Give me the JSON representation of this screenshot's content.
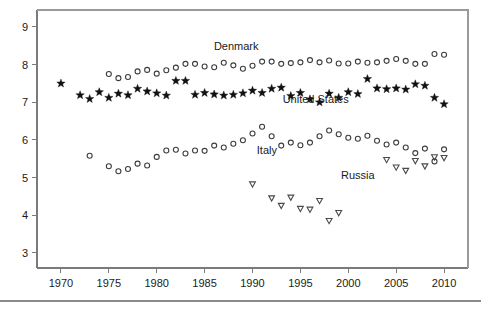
{
  "chart_data": {
    "type": "scatter",
    "title": "",
    "subtitle": "",
    "xlabel": "",
    "ylabel": "",
    "xlim": [
      1967.5,
      2012.5
    ],
    "ylim": [
      2.6,
      9.45
    ],
    "grid": false,
    "legend_position": "inline-annotations",
    "xticks": [
      1970,
      1975,
      1980,
      1985,
      1990,
      1995,
      2000,
      2005,
      2010
    ],
    "xtick_labels": [
      "1970",
      "1975",
      "1980",
      "1985",
      "1990",
      "1995",
      "2000",
      "2005",
      "2010"
    ],
    "yticks": [
      3,
      4,
      5,
      6,
      7,
      8,
      9
    ],
    "ytick_labels": [
      "3",
      "4",
      "5",
      "6",
      "7",
      "8",
      "9"
    ],
    "annotations": [
      {
        "text": "Denmark",
        "x": 1988.3,
        "y": 8.38,
        "series": "Denmark"
      },
      {
        "text": "United States",
        "x": 1996.6,
        "y": 6.97,
        "series": "United States"
      },
      {
        "text": "Italy",
        "x": 1991.5,
        "y": 5.62,
        "series": "Italy"
      },
      {
        "text": "Russia",
        "x": 2001.0,
        "y": 4.95,
        "series": "Russia"
      }
    ],
    "series": [
      {
        "name": "Denmark",
        "marker": "open-circle",
        "color": "#3d3d3d",
        "x": [
          1975,
          1976,
          1977,
          1978,
          1979,
          1980,
          1981,
          1982,
          1983,
          1984,
          1985,
          1986,
          1987,
          1988,
          1989,
          1990,
          1991,
          1992,
          1993,
          1994,
          1995,
          1996,
          1997,
          1998,
          1999,
          2000,
          2001,
          2002,
          2003,
          2004,
          2005,
          2006,
          2007,
          2008,
          2009,
          2010
        ],
        "y": [
          7.75,
          7.64,
          7.67,
          7.82,
          7.86,
          7.76,
          7.85,
          7.92,
          8.02,
          8.02,
          7.95,
          7.93,
          8.05,
          7.98,
          7.89,
          7.97,
          8.08,
          8.08,
          8.02,
          8.04,
          8.06,
          8.12,
          8.06,
          8.11,
          8.03,
          8.03,
          8.08,
          8.05,
          8.06,
          8.1,
          8.15,
          8.1,
          8.02,
          8.02,
          8.28,
          8.26
        ]
      },
      {
        "name": "United States",
        "marker": "filled-star",
        "color": "#111111",
        "x": [
          1970,
          1972,
          1973,
          1974,
          1975,
          1976,
          1977,
          1978,
          1979,
          1980,
          1981,
          1982,
          1983,
          1984,
          1985,
          1986,
          1987,
          1988,
          1989,
          1990,
          1991,
          1992,
          1993,
          1994,
          1995,
          1996,
          1997,
          1998,
          1999,
          2000,
          2001,
          2002,
          2003,
          2004,
          2005,
          2006,
          2007,
          2008,
          2009,
          2010
        ],
        "y": [
          7.5,
          7.19,
          7.09,
          7.27,
          7.12,
          7.23,
          7.19,
          7.36,
          7.29,
          7.24,
          7.18,
          7.57,
          7.57,
          7.2,
          7.25,
          7.21,
          7.18,
          7.2,
          7.24,
          7.31,
          7.25,
          7.36,
          7.39,
          7.17,
          7.25,
          7.08,
          7.0,
          7.23,
          7.12,
          7.27,
          7.22,
          7.62,
          7.37,
          7.35,
          7.37,
          7.34,
          7.48,
          7.44,
          7.12,
          6.95
        ]
      },
      {
        "name": "Italy",
        "marker": "open-circle",
        "color": "#3d3d3d",
        "x": [
          1973,
          1975,
          1976,
          1977,
          1978,
          1979,
          1980,
          1981,
          1982,
          1983,
          1984,
          1985,
          1986,
          1987,
          1988,
          1989,
          1990,
          1991,
          1992,
          1993,
          1994,
          1995,
          1996,
          1997,
          1998,
          1999,
          2000,
          2001,
          2002,
          2003,
          2004,
          2005,
          2006,
          2007,
          2008,
          2009,
          2010
        ],
        "y": [
          5.58,
          5.3,
          5.17,
          5.23,
          5.37,
          5.32,
          5.55,
          5.72,
          5.74,
          5.64,
          5.72,
          5.71,
          5.85,
          5.8,
          5.9,
          5.99,
          6.17,
          6.35,
          6.1,
          5.85,
          5.93,
          5.86,
          5.93,
          6.1,
          6.25,
          6.15,
          6.06,
          6.03,
          6.11,
          5.98,
          5.88,
          5.93,
          5.8,
          5.65,
          5.77,
          5.43,
          5.75
        ]
      },
      {
        "name": "Russia",
        "marker": "open-triangle-down",
        "color": "#4a4a4a",
        "x": [
          1990,
          1992,
          1993,
          1994,
          1995,
          1996,
          1997,
          1998,
          1999,
          2004,
          2005,
          2006,
          2007,
          2008,
          2009,
          2010
        ],
        "y": [
          4.82,
          4.45,
          4.25,
          4.47,
          4.17,
          4.15,
          4.38,
          3.85,
          4.06,
          5.47,
          5.27,
          5.18,
          5.44,
          5.3,
          5.54,
          5.52
        ]
      }
    ]
  }
}
